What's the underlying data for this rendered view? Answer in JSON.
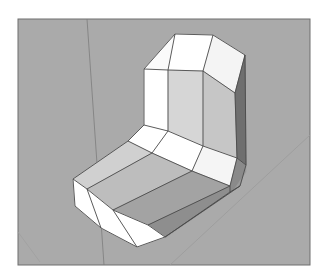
{
  "scene": {
    "title": "3D chamfered L-shaped chair model",
    "background": "#ffffff",
    "canvas_fill": "#aaaaaa",
    "canvas_frame": {
      "x": 18,
      "y": 19,
      "w": 292,
      "h": 246,
      "stroke": "#6e6e6e"
    },
    "axes": [
      {
        "name": "vertical-axis-line",
        "x1": 87,
        "y1": 19,
        "x2": 104,
        "y2": 265,
        "stroke": "#7c7c7c"
      },
      {
        "name": "diagonal-axis-line",
        "x1": 170,
        "y1": 265,
        "x2": 310,
        "y2": 135,
        "stroke": "#9a9a9a"
      },
      {
        "name": "faint-left-line",
        "x1": 18,
        "y1": 232,
        "x2": 40,
        "y2": 262,
        "stroke": "#a0a0a0"
      }
    ],
    "edge_color": "#4a4a4a",
    "faces": [
      {
        "name": "back-top-left-bevel",
        "fill": "#fafafa",
        "points": "144,69 175,34 168,70"
      },
      {
        "name": "back-top-center",
        "fill": "#ffffff",
        "points": "175,34 213,35 203,71 168,70"
      },
      {
        "name": "back-top-right-bevel",
        "fill": "#f4f4f4",
        "points": "213,35 245,55 235,93 203,71"
      },
      {
        "name": "back-left-face",
        "fill": "#ffffff",
        "points": "144,69 168,70 168,131 144,125"
      },
      {
        "name": "back-center-face",
        "fill": "#d6d6d6",
        "points": "168,70 203,71 203,146 168,131"
      },
      {
        "name": "back-right-face",
        "fill": "#c6c6c6",
        "points": "203,71 235,93 237,158 203,146"
      },
      {
        "name": "back-side-dark",
        "fill": "#6f6f6f",
        "points": "245,55 246,165 237,158 235,93"
      },
      {
        "name": "corner-left-bevel",
        "fill": "#ffffff",
        "points": "144,125 168,131 152,153 128,141"
      },
      {
        "name": "corner-center",
        "fill": "#ffffff",
        "points": "168,131 203,146 192,171 152,153"
      },
      {
        "name": "corner-right",
        "fill": "#f5f5f5",
        "points": "203,146 237,158 230,186 192,171"
      },
      {
        "name": "corner-side-dark",
        "fill": "#8a8a8a",
        "points": "237,158 246,165 240,186 230,192 230,186"
      },
      {
        "name": "seat-left-bevel",
        "fill": "#d0d0d0",
        "points": "128,141 152,153 87,189 73,179"
      },
      {
        "name": "seat-center",
        "fill": "#bdbdbd",
        "points": "152,153 192,171 113,210 87,189"
      },
      {
        "name": "seat-right",
        "fill": "#a3a3a3",
        "points": "192,171 230,186 148,225 113,210"
      },
      {
        "name": "seat-right-bevel",
        "fill": "#8e8e8e",
        "points": "230,186 230,192 165,237 148,225"
      },
      {
        "name": "seat-side-dark",
        "fill": "#9a9a9a",
        "points": "230,192 240,186 246,165 246,172 233,191 165,238 165,237"
      },
      {
        "name": "front-left-face",
        "fill": "#ffffff",
        "points": "73,179 87,189 101,228 75,206"
      },
      {
        "name": "front-center-face",
        "fill": "#ffffff",
        "points": "87,189 113,210 137,247 101,228"
      },
      {
        "name": "front-right-face",
        "fill": "#ffffff",
        "points": "113,210 148,225 165,237 137,247"
      }
    ],
    "edges": [
      "144,69 175,34 213,35 245,55",
      "144,69 168,70 203,71 235,93",
      "175,34 168,70",
      "213,35 203,71",
      "245,55 235,93",
      "245,55 246,165",
      "144,69 144,125",
      "168,70 168,131",
      "203,71 203,146",
      "235,93 237,158",
      "144,125 168,131 203,146 237,158 246,165",
      "144,125 128,141",
      "168,131 152,153",
      "203,146 192,171",
      "237,158 230,186",
      "128,141 152,153 192,171 230,186",
      "246,165 240,186 230,192",
      "230,186 230,192",
      "128,141 73,179",
      "152,153 87,189",
      "192,171 113,210",
      "230,186 148,225",
      "230,192 165,237",
      "73,179 87,189 113,210 148,225 165,237",
      "73,179 75,206 101,228 137,247 165,237",
      "87,189 101,228",
      "113,210 137,247",
      "240,186 165,237"
    ]
  }
}
